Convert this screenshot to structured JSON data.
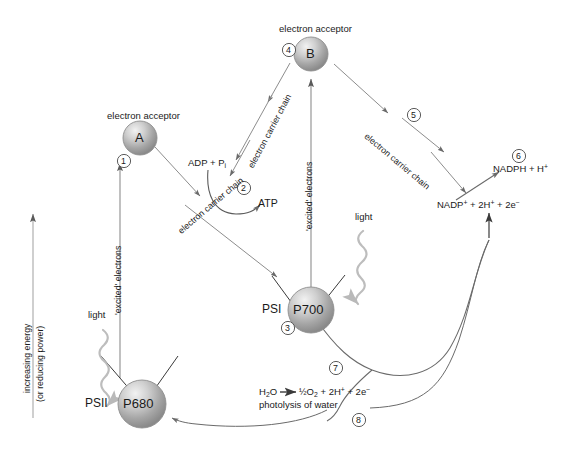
{
  "diagram": {
    "axis": {
      "label_line1": "increasing energy",
      "label_line2": "(or reducing power)"
    },
    "nodes": [
      {
        "id": "A",
        "label": "A",
        "caption": "electron acceptor",
        "step": "1"
      },
      {
        "id": "B",
        "label": "B",
        "caption": "electron acceptor",
        "step": "4"
      },
      {
        "id": "P700",
        "label": "P700",
        "caption": "PSI",
        "step": "3"
      },
      {
        "id": "P680",
        "label": "P680",
        "caption": "PSII",
        "step": ""
      }
    ],
    "steps": [
      "1",
      "2",
      "3",
      "4",
      "5",
      "6",
      "7",
      "8"
    ],
    "labels": {
      "electron_acceptor_a": "electron acceptor",
      "electron_acceptor_b": "electron acceptor",
      "psi": "PSI",
      "psii": "PSII",
      "light_left": "light",
      "light_right": "light",
      "excited_electrons_left": "'excited' electrons",
      "excited_electrons_right": "'excited' electrons",
      "ecc_left": "electron carrier chain",
      "ecc_mid": "electron carrier chain",
      "ecc_right": "electron carrier chain",
      "adp_pi": "ADP + P",
      "adp_pi_sub": "i",
      "atp": "ATP",
      "nadp_reactant": "NADP",
      "nadp_reactant_rest": " + 2H",
      "nadp_reactant_tail": " + 2e",
      "nadph_product": "NADPH + H",
      "water_reactant": "H",
      "water_products": "O",
      "photolysis": "photolysis of water"
    },
    "formulas": {
      "nadp_reduction_reactant": "NADP+ + 2H+ + 2e−",
      "nadp_reduction_product": "NADPH + H+",
      "photolysis": "H2O → ½O2 + 2H+ + 2e−"
    },
    "colors": {
      "stroke": "#6f6f6f",
      "text": "#1a1a1a",
      "sphere_light": "#e8e8e8",
      "sphere_mid": "#b4b4b4",
      "sphere_dark": "#8a8a8a",
      "axis": "#a8a8a8",
      "light_wave": "#b9b9b9"
    }
  }
}
